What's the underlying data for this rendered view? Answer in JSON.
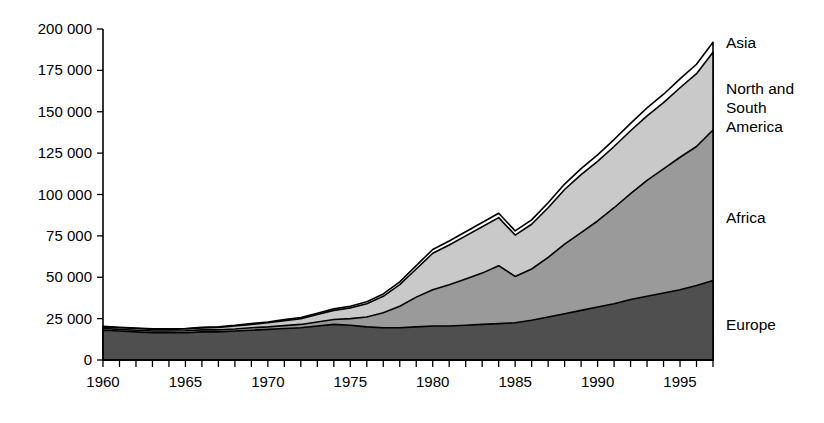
{
  "chart_data": {
    "type": "area",
    "stacked": true,
    "title": "",
    "subtitle": "",
    "xlabel": "",
    "ylabel": "",
    "grid": false,
    "legend_position": "right-inline-labels",
    "xlim": [
      1960,
      1997
    ],
    "ylim": [
      0,
      200000
    ],
    "x": [
      1960,
      1961,
      1962,
      1963,
      1964,
      1965,
      1966,
      1967,
      1968,
      1969,
      1970,
      1971,
      1972,
      1973,
      1974,
      1975,
      1976,
      1977,
      1978,
      1979,
      1980,
      1981,
      1982,
      1983,
      1984,
      1985,
      1986,
      1987,
      1988,
      1989,
      1990,
      1991,
      1992,
      1993,
      1994,
      1995,
      1996,
      1997
    ],
    "xtick_values": [
      1960,
      1965,
      1970,
      1975,
      1980,
      1985,
      1990,
      1995
    ],
    "xtick_labels": [
      "1960",
      "1965",
      "1970",
      "1975",
      "1980",
      "1985",
      "1990",
      "1995"
    ],
    "xtick_minor_every": 1,
    "ytick_values": [
      0,
      25000,
      50000,
      75000,
      100000,
      125000,
      150000,
      175000,
      200000
    ],
    "ytick_labels": [
      "0",
      "25 000",
      "50 000",
      "75 000",
      "100 000",
      "125 000",
      "150 000",
      "175 000",
      "200 000"
    ],
    "series": [
      {
        "name": "Europe",
        "label": "Europe",
        "color": "#4f4f4f",
        "values": [
          18000,
          17500,
          17000,
          16500,
          16500,
          16500,
          17000,
          17000,
          17500,
          18000,
          18500,
          19000,
          19500,
          20500,
          21500,
          21000,
          20000,
          19500,
          19500,
          20000,
          20500,
          20500,
          21000,
          21500,
          22000,
          22500,
          24000,
          26000,
          28000,
          30000,
          32000,
          34000,
          36500,
          38500,
          40500,
          42500,
          45000,
          48000
        ]
      },
      {
        "name": "Africa",
        "label": "Africa",
        "color": "#9a9a9a",
        "values": [
          1000,
          1000,
          1000,
          1000,
          1000,
          1200,
          1200,
          1200,
          1200,
          1500,
          1500,
          1800,
          2000,
          2500,
          3000,
          4000,
          6000,
          9000,
          13000,
          18000,
          22000,
          25000,
          28000,
          31000,
          35000,
          28000,
          31000,
          36000,
          42000,
          47000,
          52000,
          58000,
          64000,
          70000,
          75000,
          80000,
          84000,
          91000
        ]
      },
      {
        "name": "North and South America",
        "label": "North and\nSouth\nAmerica",
        "color": "#c9c9c9",
        "values": [
          1000,
          1000,
          1000,
          1000,
          1000,
          1000,
          1200,
          1500,
          1800,
          2000,
          2500,
          3000,
          3500,
          4500,
          5500,
          6500,
          8000,
          10000,
          13000,
          17000,
          22000,
          24000,
          26000,
          28000,
          29000,
          25000,
          27000,
          30000,
          33000,
          35000,
          36000,
          37000,
          38000,
          39000,
          40000,
          42000,
          44000,
          47000
        ]
      },
      {
        "name": "Asia",
        "label": "Asia",
        "color": "#ffffff",
        "values": [
          300,
          300,
          300,
          300,
          300,
          300,
          300,
          400,
          400,
          500,
          500,
          600,
          700,
          800,
          900,
          1000,
          1200,
          1400,
          1700,
          2000,
          2300,
          2400,
          2500,
          2600,
          2700,
          2500,
          2700,
          3000,
          3300,
          3600,
          3900,
          4200,
          4500,
          4800,
          5100,
          5400,
          5700,
          6000
        ]
      }
    ],
    "totals": [
      20300,
      19800,
      19300,
      18800,
      18800,
      19000,
      19700,
      20100,
      20900,
      22000,
      23000,
      24400,
      25700,
      28300,
      30900,
      32500,
      35200,
      39900,
      47200,
      57000,
      66800,
      71900,
      77500,
      83100,
      88700,
      78000,
      84700,
      95000,
      106300,
      115600,
      123900,
      133200,
      143000,
      152300,
      160600,
      169900,
      178700,
      192000
    ],
    "series_label_positions": [
      {
        "name": "Asia",
        "x": 726,
        "y": 48
      },
      {
        "name": "North and South America",
        "x": 726,
        "y": 94
      },
      {
        "name": "Africa",
        "x": 726,
        "y": 223
      },
      {
        "name": "Europe",
        "x": 726,
        "y": 330
      }
    ]
  },
  "plot": {
    "left": 103,
    "right": 713,
    "top": 29,
    "bottom": 360
  }
}
